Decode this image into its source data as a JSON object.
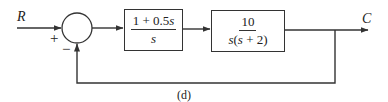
{
  "diagram": {
    "type": "feedback-control-block-diagram",
    "input_label": "R",
    "output_label": "C",
    "summing_junction": {
      "plus_sign": "+",
      "minus_sign": "−"
    },
    "blocks": [
      {
        "name": "controller",
        "numerator_prefix": "1 + 0.5",
        "numerator_var": "s",
        "denominator": "s"
      },
      {
        "name": "plant",
        "numerator": "10",
        "denominator_a": "s",
        "denominator_b": "(",
        "denominator_c": "s",
        "denominator_d": " + 2)"
      }
    ],
    "feedback": "unity negative feedback",
    "caption": "(d)"
  },
  "colors": {
    "line": "#333333",
    "background": "#ffffff",
    "text": "#222222"
  }
}
